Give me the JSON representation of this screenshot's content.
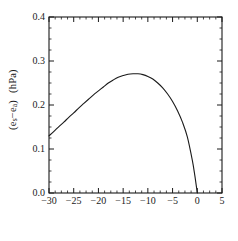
{
  "chart_data": {
    "type": "line",
    "title": "",
    "xlabel": "Temperature (°C)",
    "ylabel_main": "(e",
    "ylabel_sub1": "s",
    "ylabel_mid": "−e",
    "ylabel_sub2": "a",
    "ylabel_close": ")",
    "ylabel_units": "(hPa)",
    "xlim": [
      -30,
      5
    ],
    "ylim": [
      0.0,
      0.4
    ],
    "grid": false,
    "legend": "none",
    "xticks": [
      -30,
      -25,
      -20,
      -15,
      -10,
      -5,
      0,
      5
    ],
    "xtick_labels": [
      "−30",
      "−25",
      "−20",
      "−15",
      "−10",
      "−5",
      "0",
      "5"
    ],
    "yticks": [
      0.0,
      0.1,
      0.2,
      0.3,
      0.4
    ],
    "ytick_labels": [
      "0.0",
      "0.1",
      "0.2",
      "0.3",
      "0.4"
    ],
    "x_minor_interval": 1.25,
    "y_minor_interval": 0.025,
    "line_color": "#1a1a1a",
    "line_width": 1.1,
    "series": [
      {
        "name": "saturation vapour pressure difference",
        "x": [
          -30,
          -29,
          -28,
          -27,
          -26,
          -25,
          -24,
          -23,
          -22,
          -21,
          -20,
          -19,
          -18,
          -17,
          -16,
          -15,
          -14,
          -13,
          -12,
          -11,
          -10,
          -9,
          -8,
          -7,
          -6,
          -5,
          -4,
          -3,
          -2,
          -1,
          -0.5,
          0
        ],
        "y": [
          0.13,
          0.14,
          0.151,
          0.161,
          0.172,
          0.182,
          0.193,
          0.203,
          0.213,
          0.223,
          0.232,
          0.241,
          0.25,
          0.257,
          0.263,
          0.267,
          0.27,
          0.271,
          0.271,
          0.269,
          0.265,
          0.259,
          0.25,
          0.239,
          0.225,
          0.208,
          0.187,
          0.161,
          0.127,
          0.074,
          0.04,
          0.0
        ]
      }
    ],
    "peak": {
      "x": -12,
      "y": 0.271
    },
    "zero_crossing": {
      "x": 0,
      "y": 0.0
    },
    "left_endpoint": {
      "x": -30,
      "y": 0.13
    }
  },
  "axes": {
    "frame_color": "#1a1a1a",
    "background": "#ffffff"
  }
}
